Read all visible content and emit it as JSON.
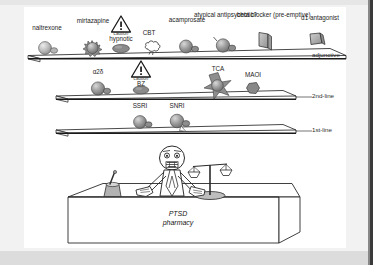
{
  "figure": {
    "title_text": "PTSD pharmacy tiered treatment shelves",
    "counter_label_line1": "PTSD",
    "counter_label_line2": "pharmacy"
  },
  "tiers": [
    {
      "id": "adjunctive",
      "tier_label": "adjunctive",
      "items": [
        {
          "label": "naltrexone",
          "icon": "sphere-capsule-icon",
          "caution": null
        },
        {
          "label": "mirtazapine",
          "icon": "spiky-sphere-icon",
          "caution": null
        },
        {
          "label": "hypnotic",
          "icon": "oval-tablet-icon",
          "caution": "caution"
        },
        {
          "label": "CBT",
          "icon": "cloud-icon",
          "caution": null
        },
        {
          "label": "acamprosate",
          "icon": "sphere-capsule-icon",
          "caution": null
        },
        {
          "label": "atypical antipsychotic?",
          "icon": "sphere-capsule-icon",
          "caution": null
        },
        {
          "label": "beta blocker (pre-emptive)",
          "icon": "parallelogram-flat-icon",
          "caution": null
        },
        {
          "label": "α1 antagonist",
          "icon": "parallelogram-block-icon",
          "caution": null
        }
      ]
    },
    {
      "id": "second-line",
      "tier_label": "2nd-line",
      "items": [
        {
          "label": "α2δ",
          "icon": "sphere-capsule-icon",
          "caution": null
        },
        {
          "label": "BZ",
          "icon": "oval-tablet-icon",
          "caution": "caution"
        },
        {
          "label": "TCA",
          "icon": "star-sphere-icon",
          "caution": null
        },
        {
          "label": "MAOI",
          "icon": "pentagon-blob-icon",
          "caution": null
        }
      ]
    },
    {
      "id": "first-line",
      "tier_label": "1st-line",
      "items": [
        {
          "label": "SSRI",
          "icon": "sphere-capsule-icon",
          "caution": null
        },
        {
          "label": "SNRI",
          "icon": "sphere-capsule-icon",
          "caution": null
        }
      ]
    }
  ],
  "counter": {
    "pharmacist": "pharmacist-figure-icon",
    "mortar": "mortar-pestle-icon",
    "scales": "balance-scales-icon"
  },
  "colors": {
    "line": "#1a1a1a",
    "shelf_fill": "#ffffff",
    "pill_fill": "#8c8c8c",
    "pill_light": "#c9c9c9",
    "caution_fill": "#ffffff",
    "text": "#1c1c1c",
    "background": "#ffffff",
    "outer": "#f2f2f2",
    "dark_edge": "#3a3a3a"
  }
}
